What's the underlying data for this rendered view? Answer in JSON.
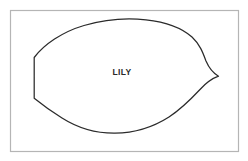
{
  "figure": {
    "background_color": "#ffffff",
    "width": 248,
    "height": 161,
    "frame": {
      "name": "image-border",
      "x": 10.5,
      "y": 10.5,
      "width": 228,
      "height": 141,
      "stroke_color": "#b5b5b5",
      "stroke_width": 1.2,
      "fill": "none"
    },
    "shape": {
      "name": "leaf-outline",
      "kind": "leaf-lens-outline",
      "stroke_color": "#2b2b2b",
      "stroke_width": 1.25,
      "fill": "none",
      "path": "M 34.2 57.5 C 44 44.5 62 32 84 25.5 C 106 19 128 17.8 146 19.8 C 166 22 182 28 192 37 C 200 44.5 203 53 206 61 C 209 68 213 73 218.5 76.2 C 212 78.5 206 83 200 89.5 C 192 98 182 108.5 169 117 C 153 127.2 134 133 115 133.2 C 96 133.4 77 127.5 62 118 C 48 109.2 39.5 102.5 34.2 98.2 Z",
      "left_edge": {
        "x": 34.2,
        "y_top": 57.5,
        "y_bottom": 98.2
      },
      "right_tip": {
        "x": 218.5,
        "y": 76.2
      },
      "top_apex": {
        "x": 136,
        "y": 19
      },
      "bottom_apex": {
        "x": 116,
        "y": 133
      }
    },
    "label": {
      "name": "shape-name-label",
      "text": "LILY",
      "x": 122,
      "y": 75,
      "color": "#2a2a2a",
      "font_size": 8.5,
      "font_weight": "bold",
      "text_anchor": "middle"
    }
  }
}
